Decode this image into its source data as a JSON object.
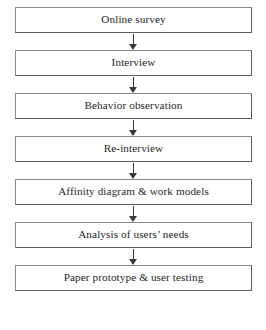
{
  "diagram": {
    "type": "flowchart",
    "orientation": "vertical",
    "caption_fragment": "",
    "colors": {
      "background": "#ffffff",
      "box_fill": "#ffffff",
      "box_border": "#8a8a8a",
      "box_border_shadow": "#5d5d5d",
      "text": "#262626",
      "arrow": "#3a3a3a"
    },
    "steps": [
      {
        "label": "Online survey"
      },
      {
        "label": "Interview"
      },
      {
        "label": "Behavior observation"
      },
      {
        "label": "Re-interview"
      },
      {
        "label": "Affinity diagram & work models"
      },
      {
        "label": "Analysis of users’ needs"
      },
      {
        "label": "Paper prototype & user testing"
      }
    ],
    "connectors": [
      {
        "name": "arrow-1",
        "from": "Online survey",
        "to": "Interview"
      },
      {
        "name": "arrow-2",
        "from": "Interview",
        "to": "Behavior observation"
      },
      {
        "name": "arrow-3",
        "from": "Behavior observation",
        "to": "Re-interview"
      },
      {
        "name": "arrow-4",
        "from": "Re-interview",
        "to": "Affinity diagram & work models"
      },
      {
        "name": "arrow-5",
        "from": "Affinity diagram & work models",
        "to": "Analysis of users’ needs"
      },
      {
        "name": "arrow-6",
        "from": "Analysis of users’ needs",
        "to": "Paper prototype & user testing"
      }
    ]
  }
}
